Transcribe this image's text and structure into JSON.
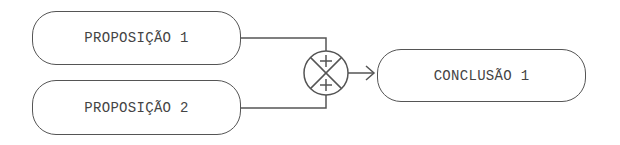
{
  "diagram": {
    "nodes": [
      {
        "id": "p1",
        "label": "PROPOSIÇÃO 1",
        "type": "premise"
      },
      {
        "id": "p2",
        "label": "PROPOSIÇÃO 2",
        "type": "premise"
      },
      {
        "id": "c1",
        "label": "CONCLUSÃO 1",
        "type": "conclusion"
      }
    ],
    "junction": {
      "symbol": "summing-junction",
      "inputs": [
        "+",
        "+"
      ]
    },
    "edges": [
      {
        "from": "p1",
        "to": "junction"
      },
      {
        "from": "p2",
        "to": "junction"
      },
      {
        "from": "junction",
        "to": "c1",
        "arrow": true
      }
    ],
    "colors": {
      "stroke": "#555555",
      "text": "#444444",
      "background": "#ffffff"
    }
  }
}
